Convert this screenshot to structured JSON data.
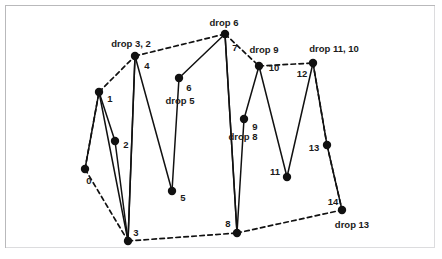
{
  "figure": {
    "title": "",
    "background_color": "#ffffff",
    "frame_color": "#b9b9bb",
    "node_color": "#111111",
    "edge_color": "#111111"
  },
  "chart_data": {
    "type": "scatter",
    "title": "",
    "xlabel": "",
    "ylabel": "",
    "xlim": [
      0,
      442
    ],
    "ylim": [
      259,
      0
    ],
    "grid": false,
    "legend": null,
    "nodes": [
      {
        "id": 0,
        "label": "0",
        "x": 85,
        "y": 169,
        "label_x": 89,
        "label_y": 181
      },
      {
        "id": 1,
        "label": "1",
        "x": 99,
        "y": 92,
        "label_x": 110,
        "label_y": 99
      },
      {
        "id": 2,
        "label": "2",
        "x": 115,
        "y": 141,
        "label_x": 126,
        "label_y": 145
      },
      {
        "id": 3,
        "label": "3",
        "x": 128,
        "y": 241,
        "label_x": 136,
        "label_y": 233
      },
      {
        "id": 4,
        "label": "4",
        "x": 135,
        "y": 56,
        "label_x": 147,
        "label_y": 66
      },
      {
        "id": 5,
        "label": "5",
        "x": 172,
        "y": 191,
        "label_x": 183,
        "label_y": 198
      },
      {
        "id": 6,
        "label": "6",
        "x": 179,
        "y": 78,
        "label_x": 189,
        "label_y": 88
      },
      {
        "id": 7,
        "label": "7",
        "x": 225,
        "y": 34,
        "label_x": 235,
        "label_y": 48
      },
      {
        "id": 8,
        "label": "8",
        "x": 237,
        "y": 233,
        "label_x": 228,
        "label_y": 224
      },
      {
        "id": 9,
        "label": "9",
        "x": 244,
        "y": 119,
        "label_x": 255,
        "label_y": 127
      },
      {
        "id": 10,
        "label": "10",
        "x": 259,
        "y": 66,
        "label_x": 274,
        "label_y": 68
      },
      {
        "id": 11,
        "label": "11",
        "x": 287,
        "y": 177,
        "label_x": 275,
        "label_y": 172
      },
      {
        "id": 12,
        "label": "12",
        "x": 313,
        "y": 63,
        "label_x": 302,
        "label_y": 74
      },
      {
        "id": 13,
        "label": "13",
        "x": 327,
        "y": 145,
        "label_x": 314,
        "label_y": 148
      },
      {
        "id": 14,
        "label": "14",
        "x": 342,
        "y": 210,
        "label_x": 333,
        "label_y": 202
      }
    ],
    "drop_labels": [
      {
        "text": "drop 3, 2",
        "x": 131,
        "y": 44
      },
      {
        "text": "drop 6",
        "x": 224,
        "y": 23
      },
      {
        "text": "drop 9",
        "x": 264,
        "y": 50
      },
      {
        "text": "drop 11, 10",
        "x": 334,
        "y": 49
      },
      {
        "text": "drop 5",
        "x": 180,
        "y": 101
      },
      {
        "text": "drop 8",
        "x": 243,
        "y": 137
      },
      {
        "text": "drop 13",
        "x": 352,
        "y": 225
      }
    ],
    "solid_edges": [
      [
        0,
        1
      ],
      [
        1,
        2
      ],
      [
        1,
        3
      ],
      [
        2,
        3
      ],
      [
        3,
        4
      ],
      [
        4,
        3
      ],
      [
        4,
        5
      ],
      [
        6,
        7
      ],
      [
        7,
        8
      ],
      [
        6,
        5
      ],
      [
        8,
        9
      ],
      [
        9,
        10
      ],
      [
        10,
        11
      ],
      [
        11,
        12
      ],
      [
        12,
        13
      ],
      [
        13,
        14
      ],
      [
        8,
        7
      ]
    ],
    "dashed_edges": [
      [
        0,
        3
      ],
      [
        0,
        1
      ],
      [
        1,
        4
      ],
      [
        4,
        7
      ],
      [
        7,
        10
      ],
      [
        10,
        12
      ],
      [
        12,
        13
      ],
      [
        13,
        14
      ],
      [
        3,
        8
      ],
      [
        8,
        14
      ]
    ]
  }
}
